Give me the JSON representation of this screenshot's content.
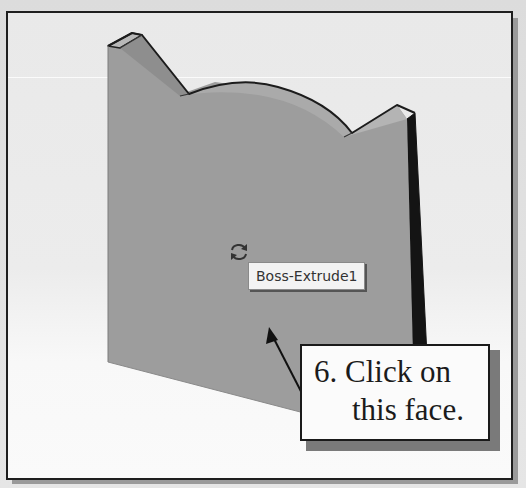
{
  "viewport": {
    "part_name": "Boss-Extrude1",
    "tooltip_label": "Boss-Extrude1",
    "cursor_icon": "rotate-icon",
    "colors": {
      "front_face": "#9b9b9b",
      "top_faces": "#b0b0b0",
      "side_face": "#141414",
      "edge": "#222222",
      "background": "#ececec"
    }
  },
  "callout": {
    "line1": "6. Click on",
    "line2": "this face.",
    "arrow_icon": "pointer-arrow"
  }
}
